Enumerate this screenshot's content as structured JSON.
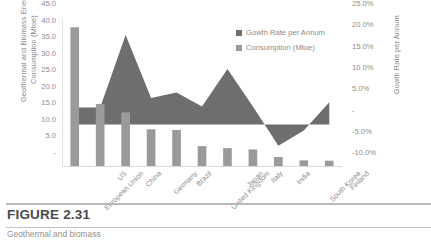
{
  "figure": {
    "label": "FIGURE 2.31",
    "caption_partial": "Geothermal and biomass"
  },
  "legend": {
    "position": "top-right",
    "items": [
      {
        "label": "Gowth Rate per Annum",
        "color": "#6e6e6e"
      },
      {
        "label": "Consumption (Mtoe)",
        "color": "#9a9a9a"
      }
    ]
  },
  "axes": {
    "left_title_line1": "Geothermal and Biomass Energy",
    "left_title_line2": "Consumption (Mtoe)",
    "right_title": "Gowth Rate per Annum",
    "left_ticks": [
      "45.0",
      "40.0",
      "35.0",
      "30.0",
      "25.0",
      "20.0",
      "15.0",
      "10.0",
      "5.0",
      "-"
    ],
    "right_ticks": [
      "25.0%",
      "20.0%",
      "15.0%",
      "10.0%",
      "5.0%",
      "-",
      "-5.0%",
      "-10.0%"
    ]
  },
  "chart_data": {
    "type": "bar",
    "title": "",
    "xlabel": "",
    "ylabel": "Geothermal and Biomass Energy Consumption (Mtoe)",
    "y2label": "Gowth Rate per Annum",
    "ylim": [
      0,
      45
    ],
    "y2lim": [
      -10,
      25
    ],
    "grid": false,
    "legend_position": "top-right",
    "categories": [
      "European Union",
      "US",
      "China",
      "Germany",
      "Brazil",
      "United Kingdom",
      "Japan",
      "Italy",
      "India",
      "South Korea",
      "Finland"
    ],
    "series": [
      {
        "name": "Consumption (Mtoe)",
        "type": "bar",
        "axis": "left",
        "unit": "Mtoe",
        "color": "#9a9a9a",
        "values": [
          42.2,
          19.0,
          16.5,
          11.4,
          11.2,
          6.3,
          5.7,
          5.3,
          3.0,
          2.0,
          1.9
        ]
      },
      {
        "name": "Gowth Rate per Annum",
        "type": "area",
        "axis": "right",
        "unit": "%",
        "color": "#6e6e6e",
        "values": [
          4.0,
          4.0,
          21.0,
          6.2,
          7.5,
          4.2,
          13.0,
          4.2,
          -5.0,
          -1.4,
          5.2
        ]
      }
    ]
  }
}
